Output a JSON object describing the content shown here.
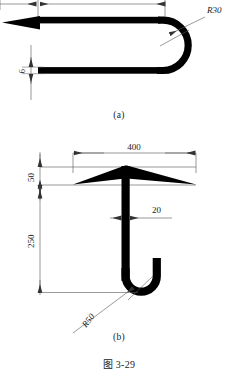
{
  "figure": {
    "caption": "图 3-29",
    "background_color": "#ffffff",
    "ink_color": "#000000",
    "line_color": "#555555"
  },
  "part_a": {
    "caption": "(a)",
    "name": "u-bend-hook-side-view",
    "dimensions": {
      "radius_label": "R30",
      "thickness_label": "6",
      "top_overall_label": "",
      "top_segment_label": ""
    }
  },
  "part_b": {
    "caption": "(b)",
    "name": "umbrella-anchor-front-view",
    "dimensions": {
      "width_label": "400",
      "cap_height_label": "50",
      "stem_height_label": "250",
      "stem_width_label": "20",
      "hook_radius_label": "R50"
    }
  }
}
